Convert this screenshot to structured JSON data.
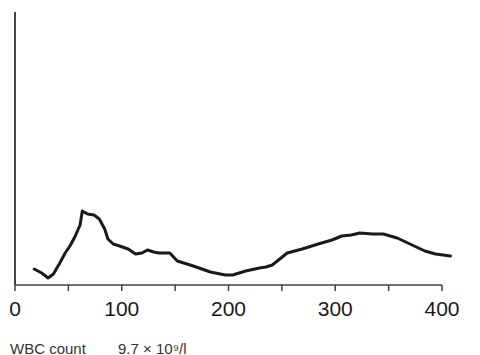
{
  "chart_data": {
    "type": "line",
    "title": "",
    "xlabel": "",
    "ylabel": "",
    "xlim": [
      0,
      400
    ],
    "x_ticks": [
      0,
      50,
      100,
      150,
      200,
      250,
      300,
      350,
      400
    ],
    "x_tick_labels": [
      "0",
      "100",
      "200",
      "300",
      "400"
    ],
    "x_tick_label_values": [
      0,
      100,
      200,
      300,
      400
    ],
    "y_axis": "unlabeled (relative frequency)",
    "grid": false,
    "legend": null,
    "series": [
      {
        "name": "WBC distribution",
        "x": [
          18,
          25,
          31,
          36,
          42,
          47,
          52,
          56,
          61,
          63,
          68,
          74,
          79,
          84,
          87,
          92,
          98,
          106,
          113,
          119,
          124,
          130,
          135,
          145,
          152,
          167,
          183,
          197,
          204,
          216,
          229,
          235,
          241,
          255,
          269,
          284,
          297,
          306,
          315,
          323,
          335,
          345,
          358,
          370,
          384,
          394,
          408
        ],
        "y": [
          16,
          12,
          7,
          11,
          22,
          32,
          40,
          48,
          60,
          74,
          71,
          70,
          66,
          56,
          46,
          41,
          39,
          36,
          31,
          32,
          35,
          33,
          32,
          32,
          24,
          19,
          13,
          10,
          10,
          14,
          17,
          18,
          20,
          32,
          36,
          41,
          45,
          49,
          50,
          52,
          51,
          51,
          47,
          41,
          34,
          31,
          29
        ]
      }
    ]
  },
  "caption": {
    "label": "WBC count",
    "value": "9.7 × 10⁹/l"
  }
}
